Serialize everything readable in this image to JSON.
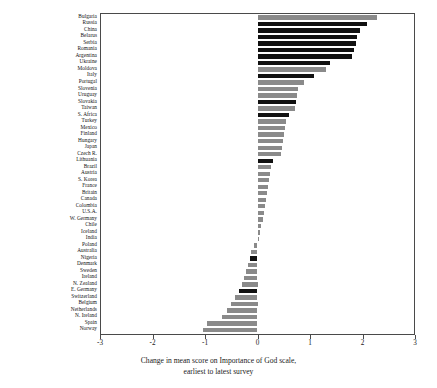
{
  "chart_data": {
    "type": "bar",
    "orientation": "horizontal",
    "title": "",
    "xlabel": "Change in mean score on Importance of God scale, earliest to latest survey",
    "ylabel": "",
    "xlim": [
      -3,
      3
    ],
    "xticks": [
      -3,
      -2,
      -1,
      0,
      1,
      2,
      3
    ],
    "xtick_labels": [
      "-3",
      "-2",
      "-1",
      "0",
      "1",
      "2",
      "3"
    ],
    "grid": false,
    "legend": "none",
    "categories": [
      "Bulgaria",
      "Russia",
      "China",
      "Belarus",
      "Serbia",
      "Romania",
      "Argentina",
      "Ukraine",
      "Moldova",
      "Italy",
      "Portugal",
      "Slovenia",
      "Uruguay",
      "Slovakia",
      "Taiwan",
      "S. Africa",
      "Turkey",
      "Mexico",
      "Finland",
      "Hungary",
      "Japan",
      "Czech R.",
      "Lithuania",
      "Brazil",
      "Austria",
      "S. Korea",
      "France",
      "Britain",
      "Canada",
      "Colombia",
      "U.S.A.",
      "W. Germany",
      "Chile",
      "Iceland",
      "India",
      "Poland",
      "Australia",
      "Nigeria",
      "Denmark",
      "Sweden",
      "Ireland",
      "N. Zealand",
      "E. Germany",
      "Switzerland",
      "Belgium",
      "Netherlands",
      "N. Ireland",
      "Spain",
      "Norway"
    ],
    "values": [
      2.27,
      2.08,
      1.95,
      1.9,
      1.87,
      1.84,
      1.8,
      1.38,
      1.3,
      1.08,
      0.88,
      0.77,
      0.76,
      0.74,
      0.72,
      0.6,
      0.55,
      0.53,
      0.5,
      0.48,
      0.46,
      0.44,
      0.3,
      0.26,
      0.24,
      0.22,
      0.2,
      0.18,
      0.16,
      0.14,
      0.12,
      0.1,
      0.07,
      0.04,
      0.02,
      -0.06,
      -0.12,
      -0.14,
      -0.18,
      -0.22,
      -0.26,
      -0.3,
      -0.36,
      -0.42,
      -0.5,
      -0.58,
      -0.67,
      -0.97,
      -1.03
    ],
    "bar_colors": [
      "#8a8a8a",
      "#111111",
      "#111111",
      "#111111",
      "#111111",
      "#111111",
      "#111111",
      "#111111",
      "#8a8a8a",
      "#111111",
      "#8a8a8a",
      "#8a8a8a",
      "#8a8a8a",
      "#111111",
      "#8a8a8a",
      "#111111",
      "#8a8a8a",
      "#8a8a8a",
      "#8a8a8a",
      "#8a8a8a",
      "#8a8a8a",
      "#8a8a8a",
      "#111111",
      "#8a8a8a",
      "#8a8a8a",
      "#8a8a8a",
      "#8a8a8a",
      "#8a8a8a",
      "#8a8a8a",
      "#8a8a8a",
      "#8a8a8a",
      "#8a8a8a",
      "#8a8a8a",
      "#8a8a8a",
      "#8a8a8a",
      "#8a8a8a",
      "#8a8a8a",
      "#111111",
      "#8a8a8a",
      "#8a8a8a",
      "#8a8a8a",
      "#8a8a8a",
      "#111111",
      "#8a8a8a",
      "#8a8a8a",
      "#8a8a8a",
      "#8a8a8a",
      "#8a8a8a",
      "#8a8a8a"
    ],
    "axis_title_lines": [
      "Change in mean score on Importance of God scale,",
      "earliest to latest survey"
    ],
    "colors": {
      "dark_bar": "#111111",
      "light_bar": "#8a8a8a",
      "axis": "#4a4a4a",
      "background": "#ffffff",
      "text": "#1a1a1a"
    }
  }
}
